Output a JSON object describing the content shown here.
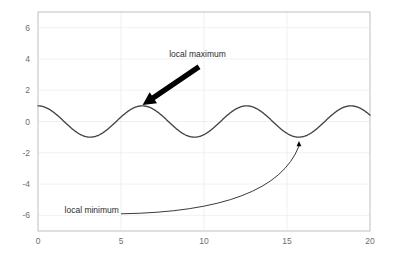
{
  "chart_data": {
    "type": "line",
    "title": "",
    "subtitle": "",
    "xlabel": "",
    "ylabel": "",
    "xlim": [
      0,
      20
    ],
    "ylim": [
      -7,
      7
    ],
    "grid": true,
    "legend": null,
    "function": "y = cos(x)",
    "series": [
      {
        "name": "cos(x)",
        "color": "#444444",
        "x": [
          0,
          0.5,
          1,
          1.5,
          2,
          2.5,
          3,
          3.5,
          4,
          4.5,
          5,
          5.5,
          6,
          6.5,
          7,
          7.5,
          8,
          8.5,
          9,
          9.5,
          10,
          10.5,
          11,
          11.5,
          12,
          12.5,
          13,
          13.5,
          14,
          14.5,
          15,
          15.5,
          16,
          16.5,
          17,
          17.5,
          18,
          18.5,
          19,
          19.5,
          20
        ],
        "y": [
          1.0,
          0.878,
          0.54,
          0.071,
          -0.416,
          -0.801,
          -0.99,
          -0.936,
          -0.654,
          -0.211,
          0.284,
          0.709,
          0.96,
          0.977,
          0.754,
          0.347,
          -0.146,
          -0.602,
          -0.911,
          -0.997,
          -0.839,
          -0.483,
          -0.004,
          0.483,
          0.844,
          0.999,
          0.907,
          0.595,
          0.137,
          -0.353,
          -0.76,
          -0.978,
          -0.958,
          -0.706,
          -0.275,
          0.221,
          0.66,
          0.939,
          0.988,
          0.798,
          0.408
        ]
      }
    ],
    "xticks": [
      {
        "value": 0,
        "label": "0"
      },
      {
        "value": 5,
        "label": "5"
      },
      {
        "value": 10,
        "label": "10"
      },
      {
        "value": 15,
        "label": "15"
      },
      {
        "value": 20,
        "label": "20"
      }
    ],
    "yticks": [
      {
        "value": 6,
        "label": "6"
      },
      {
        "value": 4,
        "label": "4"
      },
      {
        "value": 2,
        "label": "2"
      },
      {
        "value": 0,
        "label": "0"
      },
      {
        "value": -2,
        "label": "-2"
      },
      {
        "value": -4,
        "label": "-4"
      },
      {
        "value": -6,
        "label": "-6"
      }
    ],
    "annotations": [
      {
        "id": "local-maximum",
        "text": "local maximum",
        "text_x": 7.9,
        "text_y": 4.15,
        "arrow_style": "thick-straight",
        "arrow_from_x": 9.7,
        "arrow_from_y": 3.5,
        "arrow_to_x": 6.3,
        "arrow_to_y": 1.05,
        "color": "#000000"
      },
      {
        "id": "local-minimum",
        "text": "local minimum",
        "text_x": 1.6,
        "text_y": -5.85,
        "arrow_style": "thin-curved",
        "arrow_from_x": 5.0,
        "arrow_from_y": -5.9,
        "arrow_to_x": 15.72,
        "arrow_to_y": -1.25,
        "color": "#3a3a3a"
      }
    ]
  },
  "axes": {
    "x_tick_labels": [
      "0",
      "5",
      "10",
      "15",
      "20"
    ],
    "y_tick_labels": [
      "6",
      "4",
      "2",
      "0",
      "-2",
      "-4",
      "-6"
    ]
  },
  "annotations_text": {
    "local_maximum": "local maximum",
    "local_minimum": "local minimum"
  },
  "colors": {
    "curve": "#444444",
    "grid": "#e9e9ef",
    "spine": "#b9b9c2",
    "tick_text": "#6e6e6e",
    "annotation_text": "#2b2b2b",
    "arrow_thick": "#000000",
    "background": "#ffffff"
  }
}
